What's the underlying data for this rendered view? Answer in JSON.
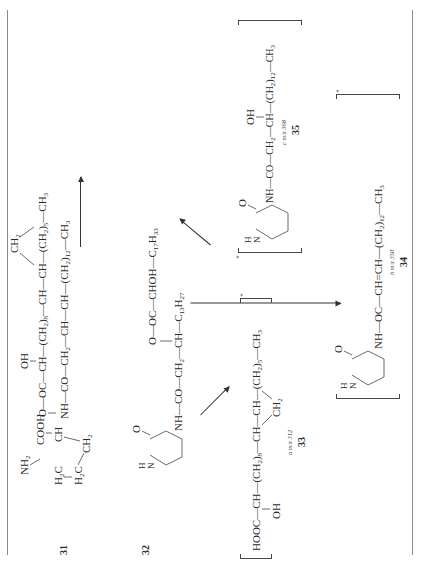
{
  "page": {
    "orientation": "rotated-90-ccw",
    "caption": "Scheme"
  },
  "compounds": {
    "c31": {
      "label": "31",
      "ring": {
        "nh2": "NH",
        "nh2_sub": "2",
        "cooh": "COOH",
        "ch": "CH",
        "h2c_a": "H",
        "h2c_b": "H",
        "ch2": "CH"
      },
      "chain_top": "O—OC—CH—(CH₂)₈—CH—CH—(CH₂)₅—CH₃",
      "oh": "OH",
      "cp_ch2": "CH₂",
      "chain_main": "NH—CO—CH₂—CH—CH—(CH₂)₁₂—CH₃"
    },
    "c32": {
      "label": "32",
      "hn": "H\nN",
      "carbonyl_o": "O",
      "chain_top": "O—OC—CHOH—C₁₇H₃₃",
      "chain_main": "NH—CO—CH₂—CH—C₁₃H₂₇"
    },
    "c33": {
      "label": "33",
      "mz": "a  m/z 312",
      "chain": "HOOC—CH—(CH₂)₈—CH—CH—(CH₂)₅—CH₃",
      "oh": "OH",
      "cp_ch2": "CH₂",
      "charge": "+"
    },
    "c34": {
      "label": "34",
      "mz": "b  m/z 350",
      "chain": "NH—OC—CH=CH—(CH₂)₁₂—CH₃",
      "hn": "H\nN",
      "carbonyl_o": "O",
      "charge": "+"
    },
    "c35": {
      "label": "35",
      "mz": "c  m/z 368",
      "chain": "NH—CO—CH₂—CH—(CH₂)₁₂—CH₃",
      "oh": "OH",
      "hn": "H\nN",
      "carbonyl_o": "O",
      "charge": "+"
    }
  },
  "arrows": [
    {
      "from": "31",
      "to": "32"
    },
    {
      "from": "32",
      "to": "33"
    },
    {
      "from": "32",
      "to": "34"
    },
    {
      "from": "32",
      "to": "35"
    }
  ]
}
